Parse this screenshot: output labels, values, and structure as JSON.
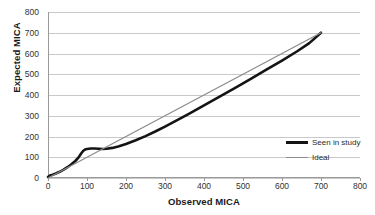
{
  "chart_data": {
    "type": "line",
    "title": "",
    "xlabel": "Observed MICA",
    "ylabel": "Expected MICA",
    "xlim": [
      0,
      800
    ],
    "ylim": [
      0,
      800
    ],
    "xticks": [
      0,
      100,
      200,
      300,
      400,
      500,
      600,
      700,
      800
    ],
    "yticks": [
      0,
      100,
      200,
      300,
      400,
      500,
      600,
      700,
      800
    ],
    "grid": "horizontal",
    "legend_position": "inside-right",
    "series": [
      {
        "name": "Seen in study",
        "color": "#141414",
        "width": 2.6,
        "x": [
          0,
          5,
          12,
          20,
          30,
          40,
          50,
          60,
          70,
          78,
          85,
          90,
          95,
          100,
          110,
          120,
          130,
          140,
          150,
          165,
          180,
          200,
          225,
          250,
          275,
          300,
          330,
          360,
          400,
          440,
          480,
          520,
          560,
          600,
          640,
          670,
          700
        ],
        "y": [
          5,
          12,
          16,
          22,
          30,
          40,
          52,
          66,
          82,
          98,
          118,
          130,
          137,
          140,
          142,
          142,
          141,
          140,
          141,
          145,
          152,
          164,
          182,
          202,
          224,
          248,
          278,
          308,
          350,
          392,
          434,
          478,
          522,
          566,
          612,
          650,
          700
        ]
      },
      {
        "name": "Ideal",
        "color": "#8c8c8c",
        "width": 1.3,
        "x": [
          0,
          700
        ],
        "y": [
          0,
          700
        ]
      }
    ],
    "legend": [
      {
        "label": "Seen in study",
        "color": "#141414",
        "style": "thick"
      },
      {
        "label": "Ideal",
        "color": "#8c8c8c",
        "style": "thin"
      }
    ]
  },
  "colors": {
    "background": "#ffffff",
    "gridline": "#c9c9c9",
    "axis": "#9a9a9a",
    "text": "#1a1a1a",
    "series_observed": "#141414",
    "series_ideal": "#8c8c8c"
  }
}
